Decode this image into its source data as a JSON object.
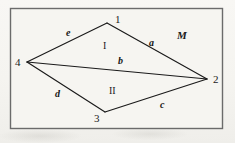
{
  "figure": {
    "frame": {
      "border_color": "#6b6b6b",
      "background_color": "#f6f5f1",
      "x": 10,
      "y": 8,
      "width": 213,
      "height": 121
    },
    "line_color": "#1a1a1a",
    "vertices": [
      {
        "id": "1",
        "label": "1",
        "x": 107,
        "y": 23,
        "label_x": 115,
        "label_y": 14
      },
      {
        "id": "2",
        "label": "2",
        "x": 207,
        "y": 79,
        "label_x": 213,
        "label_y": 74
      },
      {
        "id": "3",
        "label": "3",
        "x": 105,
        "y": 112,
        "label_x": 94,
        "label_y": 113
      },
      {
        "id": "4",
        "label": "4",
        "x": 27,
        "y": 62,
        "label_x": 15,
        "label_y": 57
      }
    ],
    "edges": [
      {
        "name": "e",
        "label": "e",
        "from": "4",
        "to": "1",
        "label_x": 66,
        "label_y": 28
      },
      {
        "name": "a",
        "label": "a",
        "from": "1",
        "to": "2",
        "label_x": 149,
        "label_y": 38
      },
      {
        "name": "b",
        "label": "b",
        "from": "4",
        "to": "2",
        "label_x": 118,
        "label_y": 56,
        "is_diagonal": true
      },
      {
        "name": "c",
        "label": "c",
        "from": "3",
        "to": "2",
        "label_x": 160,
        "label_y": 100
      },
      {
        "name": "d",
        "label": "d",
        "from": "4",
        "to": "3",
        "label_x": 55,
        "label_y": 89
      }
    ],
    "regions": [
      {
        "name": "region-one",
        "label": "I",
        "x": 103,
        "y": 41
      },
      {
        "name": "region-two",
        "label": "II",
        "x": 109,
        "y": 86
      },
      {
        "name": "region-m",
        "label": "M",
        "x": 177,
        "y": 30
      }
    ]
  }
}
